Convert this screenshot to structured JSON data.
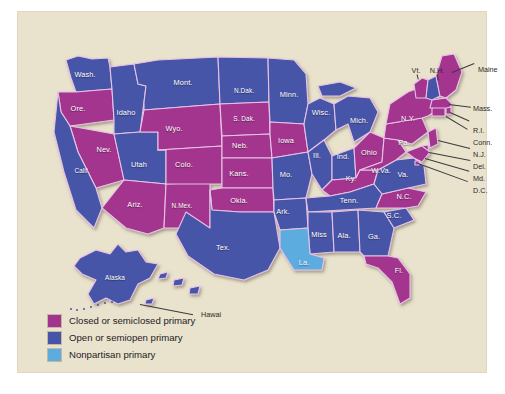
{
  "figure": {
    "background_color": "#e9e2cd",
    "border_color": "#ffffff"
  },
  "colors": {
    "closed": "#A3348E",
    "open": "#4755A8",
    "nonpartisan": "#5CACE0",
    "state_border": "#e8c3e6",
    "label_text": "#ffffff",
    "callout_text": "#2a2a2a",
    "plate": "#e9e2cd"
  },
  "legend": {
    "items": [
      {
        "swatch": "#A3348E",
        "label": "Closed or semiclosed primary",
        "key": "closed"
      },
      {
        "swatch": "#4755A8",
        "label": "Open or semiopen primary",
        "key": "open"
      },
      {
        "swatch": "#5CACE0",
        "label": "Nonpartisan primary",
        "key": "nonpartisan"
      }
    ]
  },
  "states": [
    {
      "abbr": "Wash.",
      "label": "Wash.",
      "category": "open",
      "fill": "#4755A8",
      "x": 67,
      "y": 62
    },
    {
      "abbr": "Ore.",
      "label": "Ore.",
      "category": "closed",
      "fill": "#A3348E",
      "x": 60,
      "y": 96
    },
    {
      "abbr": "Idaho",
      "label": "Idaho",
      "category": "open",
      "fill": "#4755A8",
      "x": 108,
      "y": 100
    },
    {
      "abbr": "Mont.",
      "label": "Mont.",
      "category": "open",
      "fill": "#4755A8",
      "x": 165,
      "y": 70
    },
    {
      "abbr": "N.Dak.",
      "label": "N.Dak.",
      "category": "open",
      "fill": "#4755A8",
      "x": 226,
      "y": 78
    },
    {
      "abbr": "Minn.",
      "label": "Minn.",
      "category": "open",
      "fill": "#4755A8",
      "x": 271,
      "y": 82
    },
    {
      "abbr": "Wisc.",
      "label": "Wisc.",
      "category": "open",
      "fill": "#4755A8",
      "x": 303,
      "y": 100
    },
    {
      "abbr": "Mich.",
      "label": "Mich.",
      "category": "open",
      "fill": "#4755A8",
      "x": 341,
      "y": 108
    },
    {
      "abbr": "S.Dak.",
      "label": "S. Dak.",
      "category": "closed",
      "fill": "#A3348E",
      "x": 226,
      "y": 106
    },
    {
      "abbr": "Wyo.",
      "label": "Wyo.",
      "category": "closed",
      "fill": "#A3348E",
      "x": 156,
      "y": 116
    },
    {
      "abbr": "Nev.",
      "label": "Nev.",
      "category": "closed",
      "fill": "#A3348E",
      "x": 86,
      "y": 137
    },
    {
      "abbr": "Calif.",
      "label": "Calif.",
      "category": "open",
      "fill": "#4755A8",
      "x": 64,
      "y": 158
    },
    {
      "abbr": "Utah",
      "label": "Utah",
      "category": "open",
      "fill": "#4755A8",
      "x": 121,
      "y": 152
    },
    {
      "abbr": "Colo.",
      "label": "Colo.",
      "category": "closed",
      "fill": "#A3348E",
      "x": 166,
      "y": 152
    },
    {
      "abbr": "Neb.",
      "label": "Neb.",
      "category": "closed",
      "fill": "#A3348E",
      "x": 222,
      "y": 133
    },
    {
      "abbr": "Iowa",
      "label": "Iowa",
      "category": "closed",
      "fill": "#A3348E",
      "x": 268,
      "y": 128
    },
    {
      "abbr": "Ill.",
      "label": "Ill.",
      "category": "open",
      "fill": "#4755A8",
      "x": 299,
      "y": 143
    },
    {
      "abbr": "Ind.",
      "label": "Ind.",
      "category": "open",
      "fill": "#4755A8",
      "x": 325,
      "y": 144
    },
    {
      "abbr": "Ohio",
      "label": "Ohio",
      "category": "closed",
      "fill": "#A3348E",
      "x": 351,
      "y": 140
    },
    {
      "abbr": "Pa.",
      "label": "Pa.",
      "category": "closed",
      "fill": "#A3348E",
      "x": 386,
      "y": 130
    },
    {
      "abbr": "N.Y.",
      "label": "N.Y.",
      "category": "closed",
      "fill": "#A3348E",
      "x": 390,
      "y": 106
    },
    {
      "abbr": "Kans.",
      "label": "Kans.",
      "category": "closed",
      "fill": "#A3348E",
      "x": 221,
      "y": 161
    },
    {
      "abbr": "Mo.",
      "label": "Mo.",
      "category": "open",
      "fill": "#4755A8",
      "x": 268,
      "y": 162
    },
    {
      "abbr": "Ky.",
      "label": "Ky.",
      "category": "closed",
      "fill": "#A3348E",
      "x": 333,
      "y": 166
    },
    {
      "abbr": "W.Va.",
      "label": "W.Va.",
      "category": "closed",
      "fill": "#A3348E",
      "x": 363,
      "y": 158
    },
    {
      "abbr": "Va.",
      "label": "Va.",
      "category": "open",
      "fill": "#4755A8",
      "x": 385,
      "y": 162
    },
    {
      "abbr": "Okla.",
      "label": "Okla.",
      "category": "closed",
      "fill": "#A3348E",
      "x": 221,
      "y": 188
    },
    {
      "abbr": "Ark.",
      "label": "Ark.",
      "category": "open",
      "fill": "#4755A8",
      "x": 265,
      "y": 199
    },
    {
      "abbr": "Tenn.",
      "label": "Tenn.",
      "category": "open",
      "fill": "#4755A8",
      "x": 331,
      "y": 188
    },
    {
      "abbr": "N.C.",
      "label": "N.C.",
      "category": "closed",
      "fill": "#A3348E",
      "x": 386,
      "y": 184
    },
    {
      "abbr": "S.C.",
      "label": "S.C.",
      "category": "open",
      "fill": "#4755A8",
      "x": 376,
      "y": 203
    },
    {
      "abbr": "Ariz.",
      "label": "Ariz.",
      "category": "closed",
      "fill": "#A3348E",
      "x": 117,
      "y": 192
    },
    {
      "abbr": "N.Mex.",
      "label": "N.Mex.",
      "category": "closed",
      "fill": "#A3348E",
      "x": 164,
      "y": 193
    },
    {
      "abbr": "Tex.",
      "label": "Tex.",
      "category": "open",
      "fill": "#4755A8",
      "x": 205,
      "y": 235
    },
    {
      "abbr": "Miss",
      "label": "Miss",
      "category": "open",
      "fill": "#4755A8",
      "x": 301,
      "y": 222
    },
    {
      "abbr": "Ala.",
      "label": "Ala.",
      "category": "open",
      "fill": "#4755A8",
      "x": 326,
      "y": 223
    },
    {
      "abbr": "Ga.",
      "label": "Ga.",
      "category": "open",
      "fill": "#4755A8",
      "x": 356,
      "y": 224
    },
    {
      "abbr": "La.",
      "label": "La.",
      "category": "nonpartisan",
      "fill": "#5CACE0",
      "x": 286,
      "y": 250
    },
    {
      "abbr": "Fl.",
      "label": "Fl.",
      "category": "closed",
      "fill": "#A3348E",
      "x": 381,
      "y": 258
    },
    {
      "abbr": "Alaska",
      "label": "Alaska",
      "category": "open",
      "fill": "#4755A8",
      "x": 97,
      "y": 265
    }
  ],
  "callouts": [
    {
      "name": "vt",
      "label": "Vt.",
      "x": 398,
      "y": 58,
      "align": "center"
    },
    {
      "name": "nh",
      "label": "N.H.",
      "x": 419,
      "y": 58,
      "align": "center"
    },
    {
      "name": "maine",
      "label": "Maine",
      "x": 460,
      "y": 57,
      "align": "left"
    },
    {
      "name": "mass",
      "label": "Mass.",
      "x": 455,
      "y": 96,
      "align": "left"
    },
    {
      "name": "ri",
      "label": "R.I.",
      "x": 455,
      "y": 118,
      "align": "left"
    },
    {
      "name": "conn",
      "label": "Conn.",
      "x": 455,
      "y": 130,
      "align": "left"
    },
    {
      "name": "nj",
      "label": "N.J.",
      "x": 455,
      "y": 142,
      "align": "left"
    },
    {
      "name": "del",
      "label": "Del.",
      "x": 455,
      "y": 154,
      "align": "left"
    },
    {
      "name": "md",
      "label": "Md.",
      "x": 455,
      "y": 166,
      "align": "left"
    },
    {
      "name": "dc",
      "label": "D.C.",
      "x": 455,
      "y": 178,
      "align": "left"
    },
    {
      "name": "hawaii",
      "label": "Hawai",
      "x": 183,
      "y": 302,
      "align": "left"
    }
  ]
}
